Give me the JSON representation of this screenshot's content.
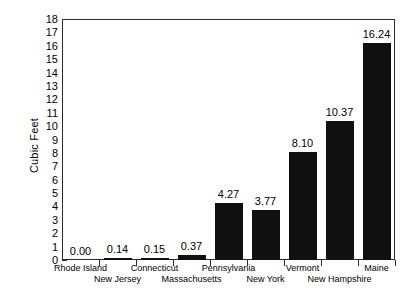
{
  "chart_data": {
    "type": "bar",
    "title": "",
    "xlabel": "",
    "ylabel": "Cubic Feet",
    "ylim": [
      0,
      18
    ],
    "ytick_step": 1,
    "yticks": [
      18,
      17,
      16,
      15,
      14,
      13,
      12,
      11,
      10,
      9,
      8,
      7,
      6,
      5,
      4,
      3,
      2,
      1,
      0
    ],
    "grid": false,
    "legend": false,
    "bar_color": "#101010",
    "frame_color": "#2b2b2b",
    "categories": [
      "Rhode Island",
      "New Jersey",
      "Connecticut",
      "Massachusetts",
      "Pennsylvania",
      "New York",
      "Vermont",
      "New Hampshire",
      "Maine"
    ],
    "values": [
      0.0,
      0.14,
      0.15,
      0.37,
      4.27,
      3.77,
      8.1,
      10.37,
      16.24
    ],
    "value_labels": [
      "0.00",
      "0.14",
      "0.15",
      "0.37",
      "4.27",
      "3.77",
      "8.10",
      "10.37",
      "16.24"
    ],
    "label_rows": [
      0,
      1,
      0,
      1,
      0,
      1,
      0,
      1,
      0
    ]
  }
}
